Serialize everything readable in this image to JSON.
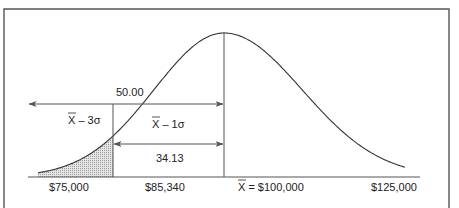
{
  "diagram": {
    "labels": {
      "upper_arrow_value": "50.00",
      "lower_arrow_value": "34.13",
      "minus_3_sigma": "X – 3σ",
      "minus_1_sigma": "X – 1σ"
    },
    "axis": {
      "tick_labels": [
        "$75,000",
        "$85,340",
        "X = $100,000",
        "$125,000"
      ]
    },
    "colors": {
      "line": "#555555",
      "curve": "#333333",
      "shade": "#bdbdbd"
    }
  }
}
